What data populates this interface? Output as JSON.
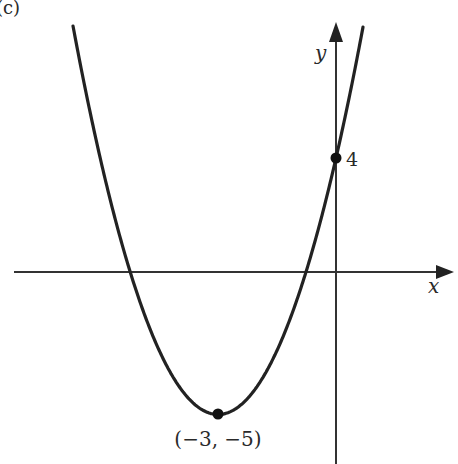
{
  "panel_label": "(c)",
  "chart_data": {
    "type": "line",
    "title": "",
    "equation": "y = (x + 3)^2 - 5",
    "xlabel": "x",
    "ylabel": "y",
    "grid": false,
    "points": [
      {
        "x": -3,
        "y": -5,
        "label": "(−3, −5)",
        "role": "vertex"
      },
      {
        "x": 0,
        "y": 4,
        "label": "4",
        "role": "y-intercept"
      }
    ],
    "x_intercepts": [
      -5.236,
      -0.764
    ],
    "xlim": [
      -8.5,
      3.1
    ],
    "ylim": [
      -6.5,
      9.5
    ]
  },
  "labels": {
    "x_axis": "x",
    "y_axis": "y",
    "y_intercept": "4",
    "vertex": "(−3, −5)"
  },
  "colors": {
    "curve": "#222222",
    "axes": "#333333",
    "background": "#ffffff"
  }
}
